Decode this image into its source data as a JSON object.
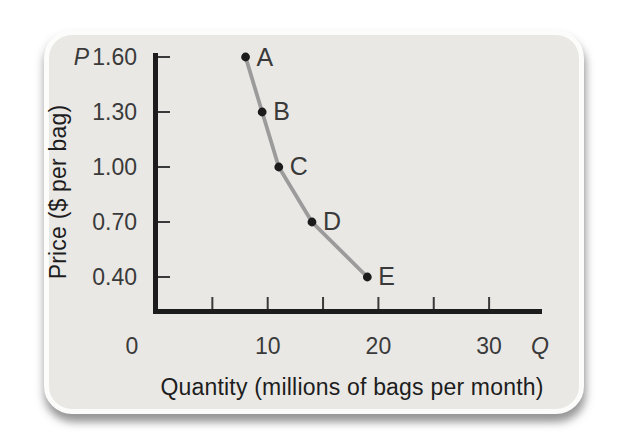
{
  "figure": {
    "page_background": "#ffffff",
    "card_background": "#e9e8e5"
  },
  "chart_data": {
    "type": "line",
    "title": "",
    "xlabel": "Quantity (millions of bags per month)",
    "ylabel": "Price ($ per bag)",
    "x_axis_letter": "Q",
    "y_axis_letter": "P",
    "x_ticks_labeled": [
      "0",
      "10",
      "20",
      "30"
    ],
    "x_ticks_minor": [
      5,
      15,
      25
    ],
    "y_ticks": [
      "1.60",
      "1.30",
      "1.00",
      "0.70",
      "0.40"
    ],
    "xlim": [
      0,
      33
    ],
    "ylim": [
      0.4,
      1.6
    ],
    "grid": "off",
    "legend": "none",
    "points": [
      {
        "label": "A",
        "quantity": 8,
        "price": 1.6
      },
      {
        "label": "B",
        "quantity": 9.5,
        "price": 1.3
      },
      {
        "label": "C",
        "quantity": 11,
        "price": 1.0
      },
      {
        "label": "D",
        "quantity": 14,
        "price": 0.7
      },
      {
        "label": "E",
        "quantity": 19,
        "price": 0.4
      }
    ],
    "curve_color": "#9b9b9b",
    "point_color": "#1c1c1c",
    "axis_color": "#1c1c1c",
    "tick_color": "#3a3a3a"
  }
}
